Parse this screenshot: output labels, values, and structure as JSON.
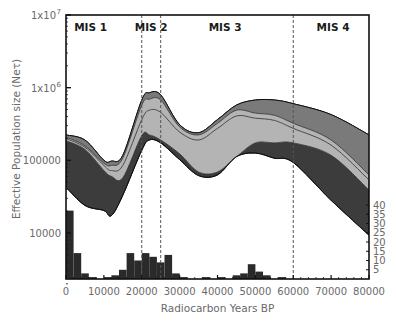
{
  "chart_data": {
    "type": "area",
    "title": "",
    "xlabel": "Radiocarbon Years BP",
    "ylabel": "Effective Population size (Neτ)",
    "y2label": "",
    "xlim": [
      0,
      80000
    ],
    "ylim_log10": [
      3.3,
      7
    ],
    "y_scale": "log",
    "y2lim": [
      0,
      40
    ],
    "grid": false,
    "x_ticks": [
      0,
      10000,
      20000,
      30000,
      40000,
      50000,
      60000,
      70000,
      80000
    ],
    "x_tick_labels": [
      "0",
      "10000",
      "20000",
      "30000",
      "40000",
      "50000",
      "60000",
      "70000",
      "80000"
    ],
    "y_ticks_log10": [
      4,
      5,
      6,
      7
    ],
    "y_tick_labels": [
      {
        "base": "10000",
        "exp": ""
      },
      {
        "base": "100000",
        "exp": ""
      },
      {
        "base": "1x10",
        "exp": "6"
      },
      {
        "base": "1x10",
        "exp": "7"
      }
    ],
    "y2_ticks": [
      5,
      10,
      15,
      20,
      25,
      30,
      35,
      40
    ],
    "y2_tick_labels": [
      "5",
      "10",
      "15",
      "20",
      "25",
      "30",
      "35",
      "40"
    ],
    "periods": [
      {
        "label": "MIS 1",
        "x": 6500
      },
      {
        "label": "MIS 2",
        "x": 22500
      },
      {
        "label": "MIS 3",
        "x": 42000
      },
      {
        "label": "MIS 4",
        "x": 70500
      }
    ],
    "boundaries": [
      20000,
      25000,
      60000
    ],
    "colors": {
      "outer_band": "#3c3c3c",
      "mid_band": "#7a7a7a",
      "inner_band": "#b4b4b4",
      "median_line": "#4a4a4a",
      "histogram": "#2a2a2a",
      "axis": "#111111",
      "boundary": "#555555"
    },
    "bsp_x": [
      0,
      5000,
      10000,
      12000,
      15000,
      20000,
      22000,
      25000,
      30000,
      35000,
      40000,
      45000,
      50000,
      55000,
      60000,
      70000,
      80000
    ],
    "series": [
      {
        "name": "95% HPD upper",
        "log10_values": [
          5.35,
          5.28,
          5.0,
          4.99,
          5.07,
          5.83,
          5.93,
          5.9,
          5.49,
          5.38,
          5.56,
          5.76,
          5.83,
          5.83,
          5.78,
          5.63,
          5.35
        ]
      },
      {
        "name": "inner upper",
        "log10_values": [
          5.32,
          5.2,
          4.96,
          4.93,
          5.03,
          5.76,
          5.84,
          5.83,
          5.46,
          5.35,
          5.51,
          5.69,
          5.65,
          5.62,
          5.51,
          5.28,
          4.8
        ]
      },
      {
        "name": "median",
        "log10_values": [
          5.3,
          5.18,
          4.93,
          4.86,
          4.93,
          5.56,
          5.69,
          5.66,
          5.39,
          5.28,
          5.44,
          5.61,
          5.58,
          5.55,
          5.44,
          5.21,
          4.73
        ]
      },
      {
        "name": "inner lower",
        "log10_values": [
          5.27,
          5.15,
          4.86,
          4.78,
          4.76,
          5.34,
          5.35,
          5.28,
          5.09,
          4.84,
          4.84,
          5.05,
          5.24,
          5.24,
          5.24,
          5.07,
          4.59
        ]
      },
      {
        "name": "95% HPD lower",
        "log10_values": [
          4.63,
          4.38,
          4.31,
          4.24,
          4.52,
          5.14,
          5.28,
          5.24,
          5.01,
          4.79,
          4.8,
          5.05,
          5.1,
          5.03,
          4.97,
          4.45,
          3.97
        ]
      }
    ],
    "histogram": {
      "name": "Radiocarbon date count",
      "bin_width": 2000,
      "bin_starts": [
        0,
        2000,
        4000,
        6000,
        8000,
        10000,
        12000,
        14000,
        16000,
        18000,
        20000,
        22000,
        24000,
        26000,
        28000,
        30000,
        32000,
        34000,
        36000,
        38000,
        40000,
        42000,
        44000,
        46000,
        48000,
        50000,
        52000,
        54000,
        56000,
        58000,
        60000
      ],
      "counts": [
        37,
        14,
        3,
        1,
        0,
        1,
        2,
        5,
        14,
        10,
        14,
        12,
        9,
        13,
        3,
        1,
        0,
        0,
        1,
        0,
        1,
        0,
        2,
        3,
        8,
        4,
        2,
        0,
        1,
        0,
        0
      ]
    }
  }
}
